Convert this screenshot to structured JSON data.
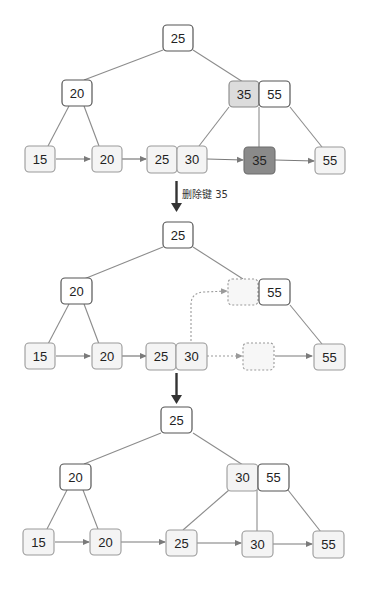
{
  "diagram": {
    "colors": {
      "internal_border": "#555555",
      "leaf_fill": "#f4f4f4",
      "highlight_fill": "#dcdcdc",
      "deleted_fill": "#8a8a8a",
      "edge": "#8c8c8c"
    },
    "step_label": "删除键 35",
    "stages": [
      {
        "name": "before",
        "root": {
          "keys": [
            "25"
          ]
        },
        "internal": [
          {
            "keys": [
              "20"
            ]
          },
          {
            "keys": [
              "35",
              "55"
            ],
            "highlight_key": "35"
          }
        ],
        "leaves": [
          {
            "keys": [
              "15"
            ]
          },
          {
            "keys": [
              "20"
            ]
          },
          {
            "keys": [
              "25",
              "30"
            ]
          },
          {
            "keys": [
              "35"
            ],
            "state": "deleted"
          },
          {
            "keys": [
              "55"
            ]
          }
        ]
      },
      {
        "name": "after-delete",
        "root": {
          "keys": [
            "25"
          ]
        },
        "internal": [
          {
            "keys": [
              "20"
            ]
          },
          {
            "keys": [
              "",
              "55"
            ],
            "empty_slot": 0
          }
        ],
        "leaves": [
          {
            "keys": [
              "15"
            ]
          },
          {
            "keys": [
              "20"
            ]
          },
          {
            "keys": [
              "25",
              "30"
            ]
          },
          {
            "keys": [
              ""
            ],
            "state": "empty"
          },
          {
            "keys": [
              "55"
            ]
          }
        ]
      },
      {
        "name": "rebalanced",
        "root": {
          "keys": [
            "25"
          ]
        },
        "internal": [
          {
            "keys": [
              "20"
            ]
          },
          {
            "keys": [
              "30",
              "55"
            ]
          }
        ],
        "leaves": [
          {
            "keys": [
              "15"
            ]
          },
          {
            "keys": [
              "20"
            ]
          },
          {
            "keys": [
              "25"
            ]
          },
          {
            "keys": [
              "30"
            ]
          },
          {
            "keys": [
              "55"
            ]
          }
        ]
      }
    ]
  }
}
